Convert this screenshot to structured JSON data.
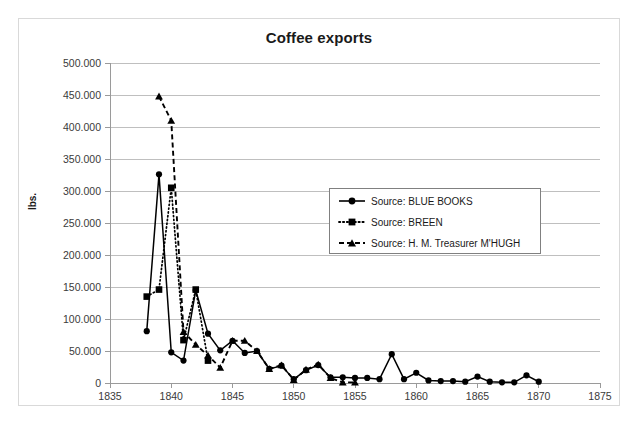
{
  "chart_data": {
    "type": "line",
    "title": "Coffee exports",
    "xlabel": "",
    "ylabel": "lbs.",
    "xlim": [
      1835,
      1875
    ],
    "ylim": [
      0,
      500000
    ],
    "xticks": [
      "1835",
      "1840",
      "1845",
      "1850",
      "1855",
      "1860",
      "1865",
      "1870",
      "1875"
    ],
    "yticks": [
      "0",
      "50.000",
      "100.000",
      "150.000",
      "200.000",
      "250.000",
      "300.000",
      "350.000",
      "400.000",
      "450.000",
      "500.000"
    ],
    "grid": "horizontal",
    "legend_position": "center-right",
    "series": [
      {
        "name": "Source: BLUE BOOKS",
        "marker": "circle",
        "line_style": "solid",
        "x": [
          1838,
          1839,
          1840,
          1841,
          1842,
          1843,
          1844,
          1845,
          1846,
          1847,
          1848,
          1849,
          1850,
          1851,
          1852,
          1853,
          1854,
          1855,
          1856,
          1857,
          1858,
          1859,
          1860,
          1861,
          1862,
          1863,
          1864,
          1865,
          1866,
          1867,
          1868,
          1869,
          1870
        ],
        "values": [
          81000,
          326000,
          48000,
          35000,
          145000,
          77000,
          51000,
          66000,
          47000,
          50000,
          22000,
          27000,
          6000,
          20000,
          28000,
          9000,
          9000,
          8000,
          8000,
          6000,
          45000,
          6000,
          16000,
          4000,
          3000,
          3000,
          2000,
          10000,
          2000,
          1000,
          1000,
          12000,
          2000
        ]
      },
      {
        "name": "Source: BREEN",
        "marker": "square",
        "line_style": "dotted",
        "x": [
          1838,
          1839,
          1840,
          1841,
          1842,
          1843
        ],
        "values": [
          135000,
          146000,
          305000,
          67000,
          146000,
          35000
        ]
      },
      {
        "name": "Source: H. M. Treasurer M'HUGH",
        "marker": "triangle",
        "line_style": "dashed",
        "x": [
          1839,
          1840,
          1841,
          1842,
          1843,
          1844,
          1845,
          1846,
          1847,
          1848,
          1849,
          1850,
          1851,
          1852,
          1853,
          1854,
          1855
        ],
        "values": [
          448000,
          410000,
          80000,
          60000,
          43000,
          24000,
          66000,
          66000,
          50000,
          22000,
          28000,
          5000,
          21000,
          29000,
          8000,
          1000,
          1000
        ]
      }
    ]
  },
  "legend": {
    "items": [
      {
        "label": "Source: BLUE BOOKS"
      },
      {
        "label": "Source: BREEN"
      },
      {
        "label": "Source: H. M. Treasurer M'HUGH"
      }
    ]
  }
}
